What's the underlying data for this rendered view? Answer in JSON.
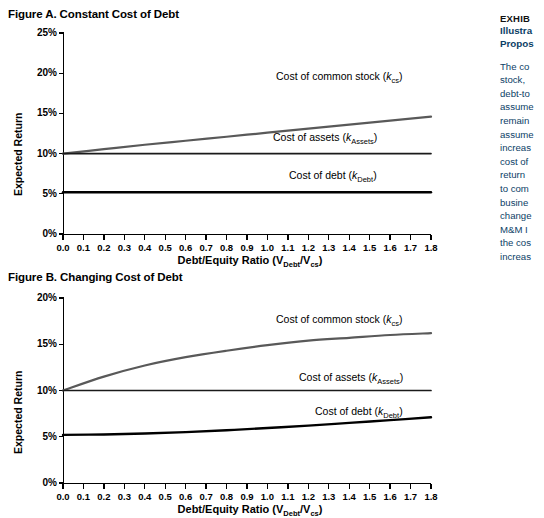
{
  "figure_a": {
    "title": "Figure A. Constant Cost of Debt",
    "ylabel": "Expected Return",
    "xlabel_main": "Debt/Equity Ratio (V",
    "xlabel_sub1": "Debt",
    "xlabel_mid": "/V",
    "xlabel_sub2": "cs",
    "xlabel_end": ")",
    "yticks": [
      "0%",
      "5%",
      "10%",
      "15%",
      "20%",
      "25%"
    ],
    "xticks": [
      "0.0",
      "0.1",
      "0.2",
      "0.3",
      "0.4",
      "0.5",
      "0.6",
      "0.7",
      "0.8",
      "0.9",
      "1.0",
      "1.1",
      "1.2",
      "1.3",
      "1.4",
      "1.5",
      "1.6",
      "1.7",
      "1.8"
    ],
    "label_cs_text": "Cost of common stock (",
    "label_cs_k": "k",
    "label_cs_sub": "cs",
    "label_cs_end": ")",
    "label_assets_text": "Cost of assets (",
    "label_assets_k": "k",
    "label_assets_sub": "Assets",
    "label_assets_end": ")",
    "label_debt_text": "Cost of debt (",
    "label_debt_k": "k",
    "label_debt_sub": "Debt",
    "label_debt_end": ")"
  },
  "figure_b": {
    "title": "Figure B. Changing Cost of Debt",
    "ylabel": "Expected Return",
    "xlabel_main": "Debt/Equity Ratio (V",
    "xlabel_sub1": "Debt",
    "xlabel_mid": "/V",
    "xlabel_sub2": "cs",
    "xlabel_end": ")",
    "yticks": [
      "0%",
      "5%",
      "10%",
      "15%",
      "20%"
    ],
    "xticks": [
      "0.0",
      "0.1",
      "0.2",
      "0.3",
      "0.4",
      "0.5",
      "0.6",
      "0.7",
      "0.8",
      "0.9",
      "1.0",
      "1.1",
      "1.2",
      "1.3",
      "1.4",
      "1.5",
      "1.6",
      "1.7",
      "1.8"
    ],
    "label_cs_text": "Cost of common stock (",
    "label_cs_k": "k",
    "label_cs_sub": "cs",
    "label_cs_end": ")",
    "label_assets_text": "Cost of assets (",
    "label_assets_k": "k",
    "label_assets_sub": "Assets",
    "label_assets_end": ")",
    "label_debt_text": "Cost of debt (",
    "label_debt_k": "k",
    "label_debt_sub": "Debt",
    "label_debt_end": ")"
  },
  "sidebar": {
    "eyebrow": "EXHIB",
    "title_line1": "Illustra",
    "title_line2": "Propos",
    "body_lines": [
      "The co",
      "stock, ",
      "debt-to",
      "assume",
      "remain",
      "assume",
      "increas",
      "cost of",
      "return",
      "to com",
      "busine",
      "change",
      "M&M I",
      "the cos",
      "increas"
    ]
  },
  "colors": {
    "cost_of_common_stock": "#595959",
    "cost_of_assets": "#1a1a1a",
    "cost_of_debt": "#000000",
    "axis": "#000000",
    "sidebar_accent": "#0b3e66"
  },
  "chart_data": [
    {
      "type": "line",
      "title": "Figure A. Constant Cost of Debt",
      "xlabel": "Debt/Equity Ratio (VDebt/Vcs)",
      "ylabel": "Expected Return",
      "xlim": [
        0.0,
        1.8
      ],
      "ylim": [
        0,
        25
      ],
      "xticks": [
        0.0,
        0.1,
        0.2,
        0.3,
        0.4,
        0.5,
        0.6,
        0.7,
        0.8,
        0.9,
        1.0,
        1.1,
        1.2,
        1.3,
        1.4,
        1.5,
        1.6,
        1.7,
        1.8
      ],
      "yticks": [
        0,
        5,
        10,
        15,
        20,
        25
      ],
      "ytick_labels": [
        "0%",
        "5%",
        "10%",
        "15%",
        "20%",
        "25%"
      ],
      "grid": false,
      "legend": "inline-annotations",
      "x": [
        0.0,
        0.2,
        0.4,
        0.6,
        0.8,
        1.0,
        1.2,
        1.4,
        1.6,
        1.8
      ],
      "series": [
        {
          "name": "Cost of common stock (kcs)",
          "values": [
            10.0,
            10.55,
            11.1,
            11.6,
            12.1,
            12.6,
            13.1,
            13.6,
            14.1,
            14.6
          ],
          "color": "#595959"
        },
        {
          "name": "Cost of assets (kAssets)",
          "values": [
            10.0,
            10.0,
            10.0,
            10.0,
            10.0,
            10.0,
            10.0,
            10.0,
            10.0,
            10.0
          ],
          "color": "#1a1a1a"
        },
        {
          "name": "Cost of debt (kDebt)",
          "values": [
            5.2,
            5.2,
            5.2,
            5.2,
            5.2,
            5.2,
            5.2,
            5.2,
            5.2,
            5.2
          ],
          "color": "#000000"
        }
      ]
    },
    {
      "type": "line",
      "title": "Figure B. Changing Cost of Debt",
      "xlabel": "Debt/Equity Ratio (VDebt/Vcs)",
      "ylabel": "Expected Return",
      "xlim": [
        0.0,
        1.8
      ],
      "ylim": [
        0,
        20
      ],
      "xticks": [
        0.0,
        0.1,
        0.2,
        0.3,
        0.4,
        0.5,
        0.6,
        0.7,
        0.8,
        0.9,
        1.0,
        1.1,
        1.2,
        1.3,
        1.4,
        1.5,
        1.6,
        1.7,
        1.8
      ],
      "yticks": [
        0,
        5,
        10,
        15,
        20
      ],
      "ytick_labels": [
        "0%",
        "5%",
        "10%",
        "15%",
        "20%"
      ],
      "grid": false,
      "legend": "inline-annotations",
      "x": [
        0.0,
        0.2,
        0.4,
        0.6,
        0.8,
        1.0,
        1.2,
        1.4,
        1.6,
        1.8
      ],
      "series": [
        {
          "name": "Cost of common stock (kcs)",
          "values": [
            10.0,
            11.5,
            12.7,
            13.6,
            14.3,
            14.9,
            15.4,
            15.7,
            16.0,
            16.2
          ],
          "color": "#595959"
        },
        {
          "name": "Cost of assets (kAssets)",
          "values": [
            10.0,
            10.0,
            10.0,
            10.0,
            10.0,
            10.0,
            10.0,
            10.0,
            10.0,
            10.0
          ],
          "color": "#1a1a1a"
        },
        {
          "name": "Cost of debt (kDebt)",
          "values": [
            5.2,
            5.25,
            5.35,
            5.5,
            5.7,
            5.95,
            6.2,
            6.5,
            6.8,
            7.1
          ],
          "color": "#000000"
        }
      ]
    }
  ]
}
